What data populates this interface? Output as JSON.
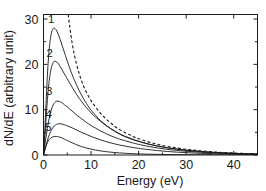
{
  "chart_data": {
    "type": "line",
    "title": "",
    "subtitle": "",
    "xlabel": "Energy (eV)",
    "ylabel": "dN/dE (arbitrary unit)",
    "xlim": [
      0,
      45
    ],
    "ylim": [
      0,
      31
    ],
    "xticks": [
      0,
      10,
      20,
      30,
      40
    ],
    "xtick_labels": [
      "0",
      "10",
      "20",
      "30",
      "40"
    ],
    "yticks": [
      0,
      10,
      20,
      30
    ],
    "ytick_labels": [
      "0",
      "10",
      "20",
      "30"
    ],
    "grid": false,
    "legend": "none",
    "frame": "box-all-sides-inward-ticks",
    "annotations": [
      {
        "text": "1",
        "x": 1.6,
        "y": 29.2
      },
      {
        "text": "2",
        "x": 1.3,
        "y": 21.6
      },
      {
        "text": "3",
        "x": 1.2,
        "y": 13.2
      },
      {
        "text": "4",
        "x": 1.1,
        "y": 8.2
      },
      {
        "text": "5",
        "x": 1.0,
        "y": 5.4
      }
    ],
    "series": [
      {
        "name": "1",
        "style": "solid",
        "color": "#1a1a1a",
        "peak_x": 2.2,
        "peak_y": 28.0,
        "points": [
          [
            0.0,
            0.0
          ],
          [
            0.3,
            6.0
          ],
          [
            0.6,
            13.0
          ],
          [
            0.9,
            19.0
          ],
          [
            1.2,
            23.4
          ],
          [
            1.5,
            26.0
          ],
          [
            1.8,
            27.4
          ],
          [
            2.2,
            28.0
          ],
          [
            2.6,
            27.7
          ],
          [
            3.0,
            26.9
          ],
          [
            3.5,
            25.5
          ],
          [
            4.0,
            23.9
          ],
          [
            4.5,
            22.3
          ],
          [
            5.0,
            20.7
          ],
          [
            6.0,
            17.8
          ],
          [
            7.0,
            15.3
          ],
          [
            8.0,
            13.2
          ],
          [
            9.0,
            11.4
          ],
          [
            10.0,
            9.9
          ],
          [
            11.0,
            8.7
          ],
          [
            12.0,
            7.6
          ],
          [
            13.0,
            6.7
          ],
          [
            14.0,
            5.9
          ],
          [
            15.0,
            5.2
          ],
          [
            16.0,
            4.6
          ],
          [
            17.0,
            4.1
          ],
          [
            18.0,
            3.7
          ],
          [
            19.0,
            3.3
          ],
          [
            20.0,
            3.0
          ],
          [
            22.0,
            2.4
          ],
          [
            24.0,
            1.95
          ],
          [
            26.0,
            1.6
          ],
          [
            28.0,
            1.3
          ],
          [
            30.0,
            1.05
          ],
          [
            32.0,
            0.85
          ],
          [
            34.0,
            0.7
          ],
          [
            36.0,
            0.55
          ],
          [
            38.0,
            0.45
          ],
          [
            40.0,
            0.35
          ],
          [
            42.0,
            0.28
          ],
          [
            44.0,
            0.22
          ],
          [
            45.0,
            0.2
          ]
        ]
      },
      {
        "name": "2",
        "style": "solid",
        "color": "#1a1a1a",
        "peak_x": 2.4,
        "peak_y": 20.7,
        "points": [
          [
            0.0,
            0.0
          ],
          [
            0.3,
            4.2
          ],
          [
            0.6,
            9.0
          ],
          [
            0.9,
            13.2
          ],
          [
            1.2,
            16.4
          ],
          [
            1.5,
            18.5
          ],
          [
            1.8,
            19.8
          ],
          [
            2.1,
            20.5
          ],
          [
            2.4,
            20.7
          ],
          [
            2.8,
            20.5
          ],
          [
            3.2,
            20.0
          ],
          [
            3.8,
            19.0
          ],
          [
            4.4,
            17.9
          ],
          [
            5.0,
            16.8
          ],
          [
            6.0,
            15.0
          ],
          [
            7.0,
            13.3
          ],
          [
            8.0,
            11.8
          ],
          [
            9.0,
            10.5
          ],
          [
            10.0,
            9.3
          ],
          [
            11.0,
            8.3
          ],
          [
            12.0,
            7.4
          ],
          [
            13.0,
            6.6
          ],
          [
            14.0,
            5.9
          ],
          [
            15.0,
            5.3
          ],
          [
            16.0,
            4.7
          ],
          [
            17.0,
            4.2
          ],
          [
            18.0,
            3.8
          ],
          [
            19.0,
            3.4
          ],
          [
            20.0,
            3.05
          ],
          [
            22.0,
            2.45
          ],
          [
            24.0,
            1.98
          ],
          [
            26.0,
            1.6
          ],
          [
            28.0,
            1.3
          ],
          [
            30.0,
            1.06
          ],
          [
            32.0,
            0.86
          ],
          [
            34.0,
            0.7
          ],
          [
            36.0,
            0.56
          ],
          [
            38.0,
            0.45
          ],
          [
            40.0,
            0.36
          ],
          [
            42.0,
            0.29
          ],
          [
            44.0,
            0.23
          ],
          [
            45.0,
            0.2
          ]
        ]
      },
      {
        "name": "3",
        "style": "solid",
        "color": "#1a1a1a",
        "peak_x": 2.8,
        "peak_y": 11.9,
        "points": [
          [
            0.0,
            0.0
          ],
          [
            0.4,
            3.0
          ],
          [
            0.8,
            5.8
          ],
          [
            1.2,
            8.1
          ],
          [
            1.6,
            9.8
          ],
          [
            2.0,
            11.0
          ],
          [
            2.4,
            11.6
          ],
          [
            2.8,
            11.9
          ],
          [
            3.3,
            11.8
          ],
          [
            3.8,
            11.6
          ],
          [
            4.4,
            11.1
          ],
          [
            5.0,
            10.6
          ],
          [
            6.0,
            9.7
          ],
          [
            7.0,
            8.8
          ],
          [
            8.0,
            8.0
          ],
          [
            9.0,
            7.2
          ],
          [
            10.0,
            6.5
          ],
          [
            11.0,
            5.9
          ],
          [
            12.0,
            5.3
          ],
          [
            13.0,
            4.8
          ],
          [
            14.0,
            4.3
          ],
          [
            15.0,
            3.9
          ],
          [
            16.0,
            3.5
          ],
          [
            17.0,
            3.2
          ],
          [
            18.0,
            2.9
          ],
          [
            19.0,
            2.6
          ],
          [
            20.0,
            2.35
          ],
          [
            22.0,
            1.9
          ],
          [
            24.0,
            1.55
          ],
          [
            26.0,
            1.25
          ],
          [
            28.0,
            1.02
          ],
          [
            30.0,
            0.83
          ],
          [
            32.0,
            0.68
          ],
          [
            34.0,
            0.55
          ],
          [
            36.0,
            0.45
          ],
          [
            38.0,
            0.36
          ],
          [
            40.0,
            0.29
          ],
          [
            42.0,
            0.24
          ],
          [
            44.0,
            0.19
          ],
          [
            45.0,
            0.17
          ]
        ]
      },
      {
        "name": "4",
        "style": "solid",
        "color": "#1a1a1a",
        "peak_x": 3.2,
        "peak_y": 6.9,
        "points": [
          [
            0.0,
            0.0
          ],
          [
            0.5,
            2.0
          ],
          [
            1.0,
            3.8
          ],
          [
            1.5,
            5.2
          ],
          [
            2.0,
            6.1
          ],
          [
            2.5,
            6.6
          ],
          [
            3.0,
            6.85
          ],
          [
            3.5,
            6.9
          ],
          [
            4.0,
            6.8
          ],
          [
            4.6,
            6.6
          ],
          [
            5.2,
            6.35
          ],
          [
            6.0,
            6.0
          ],
          [
            7.0,
            5.5
          ],
          [
            8.0,
            5.0
          ],
          [
            9.0,
            4.55
          ],
          [
            10.0,
            4.1
          ],
          [
            11.0,
            3.7
          ],
          [
            12.0,
            3.35
          ],
          [
            13.0,
            3.0
          ],
          [
            14.0,
            2.7
          ],
          [
            15.0,
            2.45
          ],
          [
            16.0,
            2.2
          ],
          [
            17.0,
            2.0
          ],
          [
            18.0,
            1.8
          ],
          [
            19.0,
            1.62
          ],
          [
            20.0,
            1.47
          ],
          [
            22.0,
            1.2
          ],
          [
            24.0,
            0.97
          ],
          [
            26.0,
            0.78
          ],
          [
            28.0,
            0.63
          ],
          [
            30.0,
            0.52
          ],
          [
            32.0,
            0.42
          ],
          [
            34.0,
            0.34
          ],
          [
            36.0,
            0.28
          ],
          [
            38.0,
            0.23
          ],
          [
            40.0,
            0.18
          ],
          [
            42.0,
            0.15
          ],
          [
            44.0,
            0.12
          ],
          [
            45.0,
            0.11
          ]
        ]
      },
      {
        "name": "5",
        "style": "solid",
        "color": "#1a1a1a",
        "peak_x": 2.6,
        "peak_y": 4.1,
        "points": [
          [
            0.0,
            0.0
          ],
          [
            0.4,
            1.5
          ],
          [
            0.8,
            2.7
          ],
          [
            1.2,
            3.4
          ],
          [
            1.6,
            3.8
          ],
          [
            2.0,
            4.0
          ],
          [
            2.4,
            4.1
          ],
          [
            2.8,
            4.1
          ],
          [
            3.2,
            4.0
          ],
          [
            3.8,
            3.8
          ],
          [
            4.4,
            3.5
          ],
          [
            5.0,
            3.2
          ],
          [
            6.0,
            2.7
          ],
          [
            7.0,
            2.25
          ],
          [
            8.0,
            1.85
          ],
          [
            9.0,
            1.55
          ],
          [
            10.0,
            1.3
          ],
          [
            11.0,
            1.08
          ],
          [
            12.0,
            0.9
          ],
          [
            13.0,
            0.76
          ],
          [
            14.0,
            0.64
          ],
          [
            15.0,
            0.54
          ],
          [
            16.0,
            0.46
          ],
          [
            17.0,
            0.39
          ],
          [
            18.0,
            0.33
          ],
          [
            19.0,
            0.28
          ],
          [
            20.0,
            0.24
          ],
          [
            22.0,
            0.18
          ],
          [
            24.0,
            0.14
          ],
          [
            26.0,
            0.11
          ],
          [
            28.0,
            0.09
          ],
          [
            30.0,
            0.07
          ],
          [
            32.0,
            0.06
          ],
          [
            34.0,
            0.05
          ],
          [
            36.0,
            0.04
          ],
          [
            38.0,
            0.03
          ],
          [
            40.0,
            0.03
          ],
          [
            42.0,
            0.02
          ],
          [
            44.0,
            0.02
          ],
          [
            45.0,
            0.02
          ]
        ]
      },
      {
        "name": "dashed",
        "style": "dashed",
        "color": "#1a1a1a",
        "points": [
          [
            5.2,
            31.0
          ],
          [
            5.5,
            28.5
          ],
          [
            5.9,
            25.5
          ],
          [
            6.4,
            22.5
          ],
          [
            7.0,
            19.8
          ],
          [
            7.6,
            17.6
          ],
          [
            8.2,
            15.8
          ],
          [
            9.0,
            13.9
          ],
          [
            10.0,
            12.0
          ],
          [
            11.0,
            10.5
          ],
          [
            12.0,
            9.2
          ],
          [
            13.0,
            8.1
          ],
          [
            14.0,
            7.2
          ],
          [
            15.0,
            6.3
          ],
          [
            16.0,
            5.6
          ],
          [
            17.0,
            5.0
          ],
          [
            18.0,
            4.5
          ],
          [
            19.0,
            4.0
          ],
          [
            20.0,
            3.6
          ],
          [
            22.0,
            2.9
          ],
          [
            24.0,
            2.35
          ],
          [
            26.0,
            1.9
          ],
          [
            28.0,
            1.55
          ],
          [
            30.0,
            1.25
          ],
          [
            32.0,
            1.02
          ],
          [
            34.0,
            0.83
          ],
          [
            36.0,
            0.67
          ],
          [
            38.0,
            0.54
          ],
          [
            40.0,
            0.44
          ],
          [
            42.0,
            0.35
          ],
          [
            44.0,
            0.28
          ],
          [
            45.0,
            0.25
          ]
        ]
      }
    ]
  }
}
